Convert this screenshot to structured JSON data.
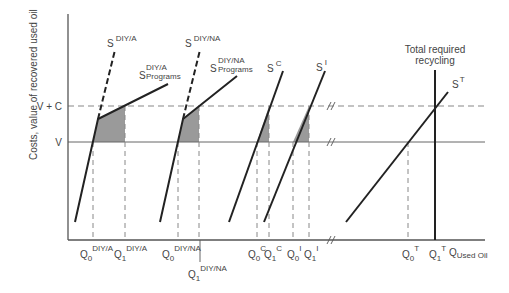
{
  "diagram": {
    "type": "supply curves / recycling cost diagram",
    "y_axis_label": "Costs, value of recovered used oil",
    "y_ticks": [
      {
        "label": "V + C",
        "y": 106
      },
      {
        "label": "V",
        "y": 142
      }
    ],
    "x_axis_label": {
      "main": "Q",
      "sub": "Used Oil"
    },
    "curves": [
      {
        "name": "S",
        "sup": "DIY/A",
        "style": "dashed"
      },
      {
        "name": "S",
        "sup": "DIY/A",
        "sub": "Programs",
        "style": "solid"
      },
      {
        "name": "S",
        "sup": "DIY/NA",
        "style": "dashed"
      },
      {
        "name": "S",
        "sup": "DIY/NA",
        "sub": "Programs",
        "style": "solid"
      },
      {
        "name": "S",
        "sup": "C",
        "style": "solid"
      },
      {
        "name": "S",
        "sup": "I",
        "style": "solid"
      },
      {
        "name": "S",
        "sup": "T",
        "style": "solid"
      }
    ],
    "vertical_line_label": [
      "Total required",
      "recycling"
    ],
    "x_ticks": [
      {
        "q": "Q",
        "sub": "0",
        "sup": "DIY/A"
      },
      {
        "q": "Q",
        "sub": "1",
        "sup": "DIY/A"
      },
      {
        "q": "Q",
        "sub": "0",
        "sup": "DIY/NA"
      },
      {
        "q": "Q",
        "sub": "1",
        "sup": "DIY/NA"
      },
      {
        "q": "Q",
        "sub": "0",
        "sup": "C"
      },
      {
        "q": "Q",
        "sub": "1",
        "sup": "C"
      },
      {
        "q": "Q",
        "sub": "0",
        "sup": "I"
      },
      {
        "q": "Q",
        "sub": "1",
        "sup": "I"
      },
      {
        "q": "Q",
        "sub": "0",
        "sup": "T"
      },
      {
        "q": "Q",
        "sub": "1",
        "sup": "T"
      }
    ],
    "colors": {
      "line": "#222222",
      "axis": "#555555",
      "dash": "#888888",
      "shade": "#999999"
    }
  }
}
